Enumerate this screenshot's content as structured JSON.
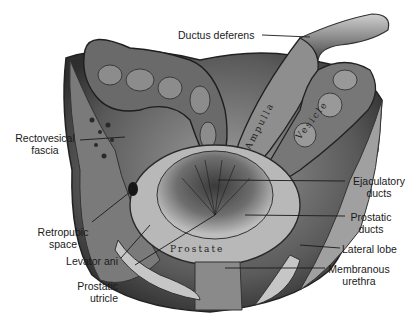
{
  "figure": {
    "background": "#ffffff",
    "ink_color": "#1a1a1a"
  },
  "labels": {
    "ductus_deferens": {
      "line1": "Ductus deferens"
    },
    "rectovesical_fascia": {
      "line1": "Rectovesical",
      "line2": "fascia"
    },
    "retropubic_space": {
      "line1": "Retropubic",
      "line2": "space"
    },
    "levator_ani": {
      "line1": "Levator ani"
    },
    "prostatic_utricle": {
      "line1": "Prostatic",
      "line2": "utricle"
    },
    "ejaculatory_ducts": {
      "line1": "Ejaculatory",
      "line2": "ducts"
    },
    "prostatic_ducts": {
      "line1": "Prostatic",
      "line2": "ducts"
    },
    "lateral_lobe": {
      "line1": "Lateral lobe"
    },
    "membranous_urethra": {
      "line1": "Membranous",
      "line2": "urethra"
    }
  },
  "in_image_labels": {
    "ampulla": "Ampulla",
    "vesicle": "Vesicle",
    "prostate": "Prostate"
  }
}
